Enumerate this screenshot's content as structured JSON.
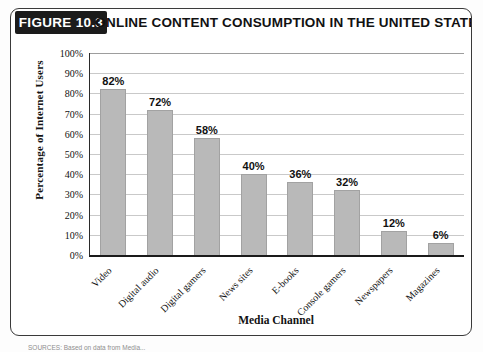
{
  "figure": {
    "tag": "FIGURE 10.3",
    "title": "ONLINE CONTENT CONSUMPTION IN THE UNITED STATES",
    "source_note": "SOURCES: Based on data from Media..."
  },
  "chart_data": {
    "type": "bar",
    "title": "ONLINE CONTENT CONSUMPTION IN THE UNITED STATES",
    "xlabel": "Media Channel",
    "ylabel": "Percentage of Internet Users",
    "categories": [
      "Video",
      "Digital audio",
      "Digital gamers",
      "News sites",
      "E-books",
      "Console gamers",
      "Newspapers",
      "Magazines"
    ],
    "values": [
      82,
      72,
      58,
      40,
      36,
      32,
      12,
      6
    ],
    "value_labels": [
      "82%",
      "72%",
      "58%",
      "40%",
      "36%",
      "32%",
      "12%",
      "6%"
    ],
    "ylim": [
      0,
      100
    ],
    "ytick_values": [
      0,
      10,
      20,
      30,
      40,
      50,
      60,
      70,
      80,
      90,
      100
    ],
    "ytick_labels": [
      "0%",
      "10%",
      "20%",
      "30%",
      "40%",
      "50%",
      "60%",
      "70%",
      "80%",
      "90%",
      "100%"
    ],
    "grid": true,
    "legend": "none",
    "bar_color": "#b9b9b9",
    "axis_color": "#1a1a1a",
    "grid_color": "#c9c9c9"
  }
}
